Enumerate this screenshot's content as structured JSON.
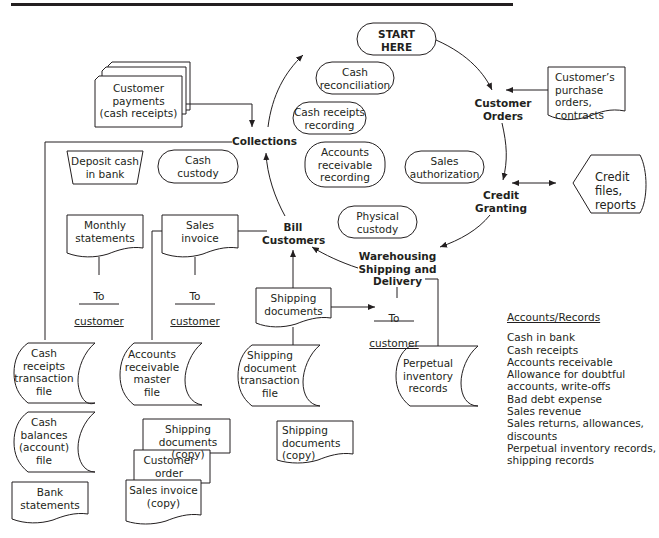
{
  "diagram": {
    "title_rule_color": "#231f20",
    "cycle_steps": [
      {
        "id": "start",
        "label": "START\nHERE"
      },
      {
        "id": "customer_orders",
        "label": "Customer\nOrders"
      },
      {
        "id": "credit_granting",
        "label": "Credit\nGranting"
      },
      {
        "id": "warehousing",
        "label": "Warehousing\nShipping and\nDelivery"
      },
      {
        "id": "bill_customers",
        "label": "Bill\nCustomers"
      },
      {
        "id": "collections",
        "label": "Collections"
      }
    ],
    "functions": [
      {
        "id": "cash_reconciliation",
        "label": "Cash\nreconciliation"
      },
      {
        "id": "cash_receipts_recording",
        "label": "Cash receipts\nrecording"
      },
      {
        "id": "ar_recording",
        "label": "Accounts\nreceivable\nrecording"
      },
      {
        "id": "sales_authorization",
        "label": "Sales\nauthorization"
      },
      {
        "id": "physical_custody",
        "label": "Physical\ncustody"
      },
      {
        "id": "cash_custody",
        "label": "Cash\ncustody"
      }
    ],
    "documents": {
      "customer_payments": "Customer\npayments\n(cash receipts)",
      "purchase_orders": "Customer’s\npurchase orders,\ncontracts",
      "credit_files": "Credit files,\nreports",
      "monthly_statements": "Monthly\nstatements",
      "sales_invoice": "Sales\ninvoice",
      "shipping_documents": "Shipping\ndocuments",
      "deposit_cash": "Deposit cash\nin bank",
      "bank_statements": "Bank\nstatements",
      "shipping_docs_copy_a": "Shipping\ndocuments (copy)",
      "customer_order": "Customer\norder",
      "sales_invoice_copy": "Sales invoice\n(copy)",
      "shipping_docs_copy_b": "Shipping\ndocuments\n(copy)"
    },
    "files": {
      "cash_receipts_file": "Cash\nreceipts\ntransaction\nfile",
      "cash_balances_file": "Cash\nbalances\n(account)\nfile",
      "ar_master_file": "Accounts\nreceivable\nmaster\nfile",
      "shipping_transaction_file": "Shipping\ndocument\ntransaction\nfile",
      "perpetual_inventory": "Perpetual\ninventory\nrecords"
    },
    "to_customer": {
      "prefix": "To",
      "word": "customer"
    }
  },
  "accounts_records": {
    "heading": "Accounts/Records",
    "items": [
      "Cash in bank",
      "Cash receipts",
      "Accounts receivable",
      "Allowance for doubtful\n   accounts, write-offs",
      "Bad debt expense",
      "Sales revenue",
      "Sales returns, allowances,\n   discounts",
      "Perpetual inventory records,\n   shipping records"
    ]
  }
}
